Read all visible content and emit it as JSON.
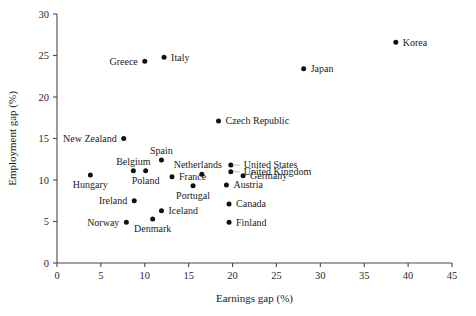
{
  "chart_data": {
    "type": "scatter",
    "title": "",
    "xlabel": "Earnings gap (%)",
    "ylabel": "Employment gap (%)",
    "xlim": [
      0,
      45
    ],
    "ylim": [
      0,
      30
    ],
    "xticks": [
      "0",
      "5",
      "10",
      "15",
      "20",
      "25",
      "30",
      "35",
      "40",
      "45"
    ],
    "xtick_values": [
      0,
      5,
      10,
      15,
      20,
      25,
      30,
      35,
      40,
      45
    ],
    "yticks": [
      "0",
      "5",
      "10",
      "15",
      "20",
      "25",
      "30"
    ],
    "ytick_values": [
      0,
      5,
      10,
      15,
      20,
      25,
      30
    ],
    "grid": false,
    "legend": "none",
    "points": [
      {
        "label": "Korea",
        "x": 38.6,
        "y": 26.6,
        "label_pos": "right"
      },
      {
        "label": "Japan",
        "x": 28.1,
        "y": 23.4,
        "label_pos": "right"
      },
      {
        "label": "Italy",
        "x": 12.2,
        "y": 24.8,
        "label_pos": "right"
      },
      {
        "label": "Greece",
        "x": 10.0,
        "y": 24.3,
        "label_pos": "left"
      },
      {
        "label": "Czech Republic",
        "x": 18.4,
        "y": 17.1,
        "label_pos": "right"
      },
      {
        "label": "New Zealand",
        "x": 7.6,
        "y": 15.0,
        "label_pos": "left"
      },
      {
        "label": "Spain",
        "x": 11.9,
        "y": 12.4,
        "label_pos": "above"
      },
      {
        "label": "Netherlands",
        "x": 16.5,
        "y": 10.7,
        "label_pos": "above-right"
      },
      {
        "label": "Belgium",
        "x": 8.7,
        "y": 11.1,
        "label_pos": "above"
      },
      {
        "label": "Poland",
        "x": 10.1,
        "y": 11.1,
        "label_pos": "below"
      },
      {
        "label": "France",
        "x": 13.1,
        "y": 10.4,
        "label_pos": "right"
      },
      {
        "label": "United States",
        "x": 19.8,
        "y": 11.8,
        "label_pos": "leader-right"
      },
      {
        "label": "United Kingdom",
        "x": 19.8,
        "y": 11.0,
        "label_pos": "leader-right"
      },
      {
        "label": "Germany",
        "x": 21.2,
        "y": 10.5,
        "label_pos": "right"
      },
      {
        "label": "Hungary",
        "x": 3.8,
        "y": 10.6,
        "label_pos": "below"
      },
      {
        "label": "Austria",
        "x": 19.3,
        "y": 9.4,
        "label_pos": "right"
      },
      {
        "label": "Portugal",
        "x": 15.5,
        "y": 9.3,
        "label_pos": "below"
      },
      {
        "label": "Ireland",
        "x": 8.8,
        "y": 7.5,
        "label_pos": "left"
      },
      {
        "label": "Canada",
        "x": 19.6,
        "y": 7.1,
        "label_pos": "right"
      },
      {
        "label": "Iceland",
        "x": 11.9,
        "y": 6.3,
        "label_pos": "right"
      },
      {
        "label": "Denmark",
        "x": 10.9,
        "y": 5.3,
        "label_pos": "below"
      },
      {
        "label": "Norway",
        "x": 7.9,
        "y": 4.9,
        "label_pos": "left"
      },
      {
        "label": "Finland",
        "x": 19.6,
        "y": 4.9,
        "label_pos": "right"
      }
    ]
  },
  "figure": {
    "background_color": "#ffffff",
    "marker_color": "#111111",
    "axis_color": "#4a4a4a",
    "text_color": "#1a1a1a"
  }
}
